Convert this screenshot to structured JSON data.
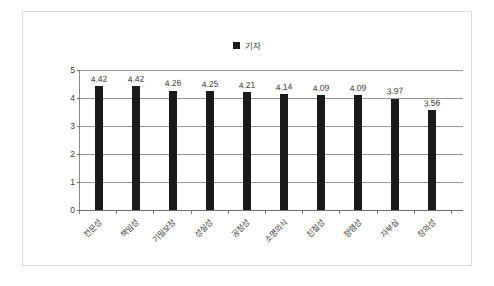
{
  "chart_data": {
    "type": "bar",
    "title": "",
    "subtitle": "",
    "xlabel": "",
    "ylabel": "",
    "ylim": [
      0,
      5
    ],
    "yticks": [
      0,
      1,
      2,
      3,
      4,
      5
    ],
    "grid": true,
    "legend_position": "top-center",
    "categories": [
      "전문성",
      "책임성",
      "기밀보장",
      "성실성",
      "공정성",
      "소명의식",
      "친절성",
      "청렴성",
      "자부심",
      "창의성"
    ],
    "series": [
      {
        "name": "기자",
        "color": "#1a1a1a",
        "values": [
          4.42,
          4.42,
          4.26,
          4.25,
          4.21,
          4.14,
          4.09,
          4.09,
          3.97,
          3.56
        ],
        "labels": [
          "4.42",
          "4.42",
          "4.26",
          "4.25",
          "4.21",
          "4.14",
          "4.09",
          "4.09",
          "3.97",
          "3.56"
        ]
      }
    ]
  },
  "legend": {
    "entries": [
      {
        "label": "기자",
        "color": "#1a1a1a"
      }
    ]
  },
  "axes": {
    "y": {
      "ticklabels": [
        "5",
        "4",
        "3",
        "2",
        "1",
        "0"
      ]
    }
  },
  "colors": {
    "bar": "#1a1a1a",
    "gridline": "#999999",
    "axis": "#6e6e6e",
    "frame_border": "#dcdcdc",
    "text": "#3b3b3b",
    "background": "#ffffff"
  }
}
